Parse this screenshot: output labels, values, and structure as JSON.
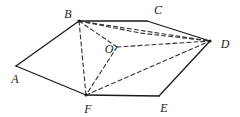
{
  "figure": {
    "kind": "geometry-diagram",
    "canvas": {
      "width": 240,
      "height": 117
    },
    "stroke_color": "#1b1b1b",
    "dash_color": "#333333",
    "background_color": "#ffffff",
    "solid_stroke_width": 1.3,
    "dashed_stroke_width": 1.1,
    "dash_pattern": "4 3",
    "labels": [
      {
        "id": "A",
        "text": "A",
        "x": 15,
        "y": 79
      },
      {
        "id": "B",
        "text": "B",
        "x": 68,
        "y": 14
      },
      {
        "id": "C",
        "text": "C",
        "x": 158,
        "y": 10
      },
      {
        "id": "D",
        "text": "D",
        "x": 225,
        "y": 44
      },
      {
        "id": "E",
        "text": "E",
        "x": 164,
        "y": 108
      },
      {
        "id": "F",
        "text": "F",
        "x": 88,
        "y": 109
      },
      {
        "id": "O",
        "text": "O",
        "x": 109,
        "y": 49
      }
    ],
    "vertices": [
      {
        "id": "A",
        "x": 16,
        "y": 66
      },
      {
        "id": "B",
        "x": 79,
        "y": 21
      },
      {
        "id": "C",
        "x": 147,
        "y": 21
      },
      {
        "id": "D",
        "x": 210,
        "y": 41
      },
      {
        "id": "E",
        "x": 159,
        "y": 96
      },
      {
        "id": "F",
        "x": 86,
        "y": 95
      },
      {
        "id": "O",
        "x": 117,
        "y": 47
      }
    ],
    "solid_edges": [
      {
        "id": "AB",
        "from": "A",
        "to": "B"
      },
      {
        "id": "BC",
        "from": "B",
        "to": "C"
      },
      {
        "id": "CD",
        "from": "C",
        "to": "D"
      },
      {
        "id": "DE",
        "from": "D",
        "to": "E"
      },
      {
        "id": "EF",
        "from": "E",
        "to": "F"
      },
      {
        "id": "FA",
        "from": "F",
        "to": "A"
      }
    ],
    "dashed_edges": [
      {
        "id": "BF",
        "from": "B",
        "to": "F"
      },
      {
        "id": "BO",
        "from": "B",
        "to": "O"
      },
      {
        "id": "BD",
        "from": "B",
        "to": "D"
      },
      {
        "id": "BD2",
        "from": "B",
        "to": "D",
        "via": {
          "x": 140,
          "y": 33
        }
      },
      {
        "id": "OD",
        "from": "O",
        "to": "D"
      },
      {
        "id": "OF",
        "from": "O",
        "to": "F"
      },
      {
        "id": "FD",
        "from": "F",
        "to": "D"
      }
    ],
    "dots": [
      {
        "id": "dot-B",
        "x": 79,
        "y": 21
      },
      {
        "id": "dot-D",
        "x": 210,
        "y": 41
      },
      {
        "id": "dot-F",
        "x": 86,
        "y": 95
      }
    ]
  }
}
